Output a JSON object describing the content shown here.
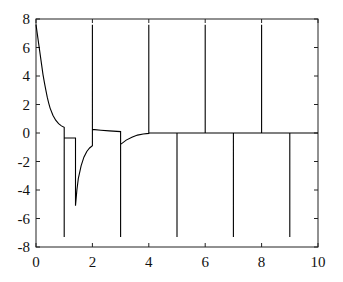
{
  "chart_data": {
    "type": "line",
    "title": "",
    "xlabel": "",
    "ylabel": "",
    "xlim": [
      0,
      10
    ],
    "ylim": [
      -8,
      8
    ],
    "grid": false,
    "legend": null,
    "x_ticks": [
      "0",
      "2",
      "4",
      "6",
      "8",
      "10"
    ],
    "y_ticks": [
      "8",
      "6",
      "4",
      "2",
      "0",
      "-2",
      "-4",
      "-6",
      "-8"
    ],
    "line_color": "#000000",
    "series": [
      {
        "name": "signal",
        "points": [
          [
            0.0,
            7.6
          ],
          [
            0.05,
            6.9
          ],
          [
            0.1,
            6.2
          ],
          [
            0.15,
            5.5
          ],
          [
            0.2,
            4.8
          ],
          [
            0.25,
            4.1
          ],
          [
            0.3,
            3.5
          ],
          [
            0.35,
            3.0
          ],
          [
            0.4,
            2.5
          ],
          [
            0.45,
            2.1
          ],
          [
            0.5,
            1.75
          ],
          [
            0.6,
            1.25
          ],
          [
            0.7,
            0.9
          ],
          [
            0.8,
            0.65
          ],
          [
            0.9,
            0.5
          ],
          [
            1.0,
            0.4
          ],
          [
            1.0,
            -7.3
          ],
          [
            1.0,
            -0.35
          ],
          [
            1.4,
            -0.35
          ],
          [
            1.4,
            -5.1
          ],
          [
            1.45,
            -4.0
          ],
          [
            1.5,
            -3.2
          ],
          [
            1.6,
            -2.3
          ],
          [
            1.7,
            -1.7
          ],
          [
            1.8,
            -1.3
          ],
          [
            1.9,
            -1.05
          ],
          [
            2.0,
            -0.9
          ],
          [
            2.0,
            7.6
          ],
          [
            2.0,
            0.25
          ],
          [
            2.3,
            0.2
          ],
          [
            2.6,
            0.15
          ],
          [
            3.0,
            0.1
          ],
          [
            3.0,
            -7.3
          ],
          [
            3.0,
            -0.8
          ],
          [
            3.2,
            -0.5
          ],
          [
            3.4,
            -0.3
          ],
          [
            3.6,
            -0.15
          ],
          [
            3.8,
            -0.07
          ],
          [
            4.0,
            -0.03
          ],
          [
            4.0,
            7.6
          ],
          [
            4.0,
            0.0
          ],
          [
            5.0,
            0.0
          ],
          [
            5.0,
            -7.3
          ],
          [
            5.0,
            0.0
          ],
          [
            6.0,
            0.0
          ],
          [
            6.0,
            7.6
          ],
          [
            6.0,
            0.0
          ],
          [
            7.0,
            0.0
          ],
          [
            7.0,
            -7.3
          ],
          [
            7.0,
            0.0
          ],
          [
            8.0,
            0.0
          ],
          [
            8.0,
            7.6
          ],
          [
            8.0,
            0.0
          ],
          [
            9.0,
            0.0
          ],
          [
            9.0,
            -7.3
          ],
          [
            9.0,
            0.0
          ],
          [
            10.0,
            0.0
          ]
        ]
      }
    ]
  }
}
